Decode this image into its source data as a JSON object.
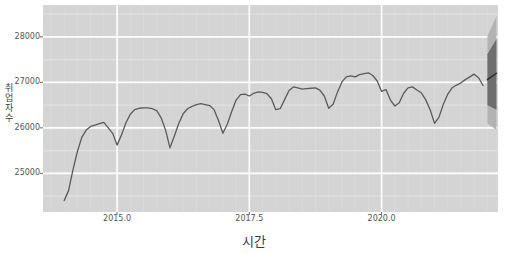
{
  "chart_data": {
    "type": "line",
    "title": "",
    "xlabel": "시간",
    "ylabel": "취업자수",
    "xlim": [
      2013.6,
      2022.2
    ],
    "ylim": [
      24150,
      28700
    ],
    "xticks": [
      2015.0,
      2017.5,
      2020.0
    ],
    "xticklabels": [
      "2015.0",
      "2017.5",
      "2020.0"
    ],
    "yticks": [
      25000,
      26000,
      27000,
      28000
    ],
    "yticklabels": [
      "25000",
      "26000",
      "27000",
      "28000"
    ],
    "grid": true,
    "legend": "none",
    "series": [
      {
        "name": "관측값",
        "color": "#5a5a5a",
        "x": [
          2014.0,
          2014.083,
          2014.167,
          2014.25,
          2014.333,
          2014.417,
          2014.5,
          2014.583,
          2014.667,
          2014.75,
          2014.833,
          2014.917,
          2015.0,
          2015.083,
          2015.167,
          2015.25,
          2015.333,
          2015.417,
          2015.5,
          2015.583,
          2015.667,
          2015.75,
          2015.833,
          2015.917,
          2016.0,
          2016.083,
          2016.167,
          2016.25,
          2016.333,
          2016.417,
          2016.5,
          2016.583,
          2016.667,
          2016.75,
          2016.833,
          2016.917,
          2017.0,
          2017.083,
          2017.167,
          2017.25,
          2017.333,
          2017.417,
          2017.5,
          2017.583,
          2017.667,
          2017.75,
          2017.833,
          2017.917,
          2018.0,
          2018.083,
          2018.167,
          2018.25,
          2018.333,
          2018.417,
          2018.5,
          2018.583,
          2018.667,
          2018.75,
          2018.833,
          2018.917,
          2019.0,
          2019.083,
          2019.167,
          2019.25,
          2019.333,
          2019.417,
          2019.5,
          2019.583,
          2019.667,
          2019.75,
          2019.833,
          2019.917,
          2020.0,
          2020.083,
          2020.167,
          2020.25,
          2020.333,
          2020.417,
          2020.5,
          2020.583,
          2020.667,
          2020.75,
          2020.833,
          2020.917,
          2021.0,
          2021.083,
          2021.167,
          2021.25,
          2021.333,
          2021.417,
          2021.5,
          2021.583,
          2021.667,
          2021.75,
          2021.833,
          2021.917
        ],
        "values": [
          24400,
          24620,
          25080,
          25480,
          25790,
          25950,
          26030,
          26060,
          26090,
          26120,
          26000,
          25880,
          25620,
          25840,
          26110,
          26300,
          26400,
          26430,
          26440,
          26440,
          26420,
          26380,
          26220,
          25950,
          25560,
          25820,
          26100,
          26310,
          26420,
          26470,
          26510,
          26530,
          26510,
          26490,
          26400,
          26160,
          25880,
          26080,
          26360,
          26610,
          26730,
          26740,
          26700,
          26760,
          26790,
          26780,
          26750,
          26640,
          26400,
          26420,
          26620,
          26820,
          26900,
          26880,
          26850,
          26860,
          26870,
          26880,
          26830,
          26700,
          26430,
          26520,
          26790,
          27010,
          27120,
          27140,
          27120,
          27170,
          27190,
          27210,
          27150,
          27030,
          26800,
          26840,
          26610,
          26480,
          26550,
          26760,
          26880,
          26900,
          26830,
          26770,
          26620,
          26400,
          26100,
          26230,
          26520,
          26740,
          26880,
          26940,
          26990,
          27060,
          27120,
          27180,
          27100,
          26930
        ]
      },
      {
        "name": "예측값",
        "color": "#2b2b2b",
        "x": [
          2022.0,
          2022.17
        ],
        "values": [
          27060,
          27200
        ]
      }
    ],
    "forecast_band": {
      "x_start": 2022.0,
      "x_end": 2022.17,
      "ci_95": {
        "color": "#b3b3b3",
        "lower_start": 26100,
        "lower_end": 25950,
        "upper_start": 28020,
        "upper_end": 28450
      },
      "ci_80": {
        "color": "#6e6e6e",
        "lower_start": 26500,
        "lower_end": 26400,
        "upper_start": 27620,
        "upper_end": 27950
      }
    },
    "style": {
      "plot_bg": "#d4d4d4",
      "major_grid": "#ffffff",
      "minor_grid": "#e6e6e6",
      "line_color": "#5a5a5a",
      "tick_color": "#555555",
      "label_color": "#3a3a3a"
    }
  }
}
